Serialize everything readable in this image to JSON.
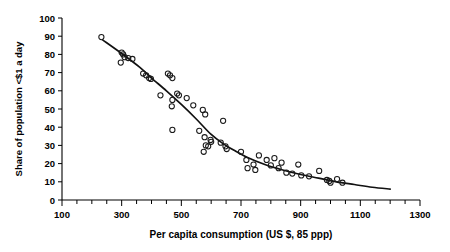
{
  "chart_data": {
    "type": "scatter",
    "title": "",
    "xlabel": "Per capita consumption (US $, 85 ppp)",
    "ylabel": "Share of population <$1 a day",
    "xlim": [
      100,
      1300
    ],
    "ylim": [
      0,
      100
    ],
    "x_ticks_major": [
      100,
      300,
      500,
      700,
      900,
      1100,
      1300
    ],
    "x_tick_labels": [
      "100",
      "300",
      "500",
      "700",
      "900",
      "1100",
      "1300"
    ],
    "x_minor_step": 50,
    "y_ticks": [
      0,
      10,
      20,
      30,
      40,
      50,
      60,
      70,
      80,
      90,
      100
    ],
    "y_tick_labels": [
      "0",
      "10",
      "20",
      "30",
      "40",
      "50",
      "60",
      "70",
      "80",
      "90",
      "100"
    ],
    "grid": false,
    "legend": null,
    "marker": "open-circle",
    "points": [
      {
        "x": 232,
        "y": 89.5
      },
      {
        "x": 300,
        "y": 81.0
      },
      {
        "x": 305,
        "y": 80.0
      },
      {
        "x": 310,
        "y": 78.5
      },
      {
        "x": 322,
        "y": 78.0
      },
      {
        "x": 336,
        "y": 77.5
      },
      {
        "x": 297,
        "y": 75.5
      },
      {
        "x": 372,
        "y": 69.5
      },
      {
        "x": 382,
        "y": 68.5
      },
      {
        "x": 392,
        "y": 67.0
      },
      {
        "x": 398,
        "y": 66.5
      },
      {
        "x": 455,
        "y": 69.5
      },
      {
        "x": 462,
        "y": 68.5
      },
      {
        "x": 470,
        "y": 67.0
      },
      {
        "x": 430,
        "y": 57.5
      },
      {
        "x": 486,
        "y": 58.5
      },
      {
        "x": 492,
        "y": 57.5
      },
      {
        "x": 470,
        "y": 55.0
      },
      {
        "x": 468,
        "y": 51.5
      },
      {
        "x": 518,
        "y": 56.0
      },
      {
        "x": 540,
        "y": 52.0
      },
      {
        "x": 572,
        "y": 49.5
      },
      {
        "x": 580,
        "y": 47.0
      },
      {
        "x": 640,
        "y": 43.5
      },
      {
        "x": 470,
        "y": 38.5
      },
      {
        "x": 560,
        "y": 38.0
      },
      {
        "x": 578,
        "y": 34.5
      },
      {
        "x": 598,
        "y": 33.0
      },
      {
        "x": 600,
        "y": 32.0
      },
      {
        "x": 582,
        "y": 30.0
      },
      {
        "x": 590,
        "y": 29.5
      },
      {
        "x": 575,
        "y": 26.5
      },
      {
        "x": 632,
        "y": 31.5
      },
      {
        "x": 648,
        "y": 29.5
      },
      {
        "x": 652,
        "y": 28.0
      },
      {
        "x": 700,
        "y": 26.5
      },
      {
        "x": 718,
        "y": 22.0
      },
      {
        "x": 742,
        "y": 19.5
      },
      {
        "x": 722,
        "y": 17.5
      },
      {
        "x": 748,
        "y": 16.5
      },
      {
        "x": 760,
        "y": 24.5
      },
      {
        "x": 786,
        "y": 22.0
      },
      {
        "x": 800,
        "y": 19.0
      },
      {
        "x": 812,
        "y": 23.0
      },
      {
        "x": 826,
        "y": 17.5
      },
      {
        "x": 836,
        "y": 20.5
      },
      {
        "x": 852,
        "y": 15.0
      },
      {
        "x": 872,
        "y": 14.5
      },
      {
        "x": 892,
        "y": 19.5
      },
      {
        "x": 902,
        "y": 13.5
      },
      {
        "x": 928,
        "y": 13.0
      },
      {
        "x": 962,
        "y": 16.0
      },
      {
        "x": 988,
        "y": 11.0
      },
      {
        "x": 996,
        "y": 10.5
      },
      {
        "x": 1000,
        "y": 9.5
      },
      {
        "x": 1022,
        "y": 11.5
      },
      {
        "x": 1040,
        "y": 9.5
      }
    ],
    "fit_curve": {
      "description": "fitted declining trend line",
      "points": [
        {
          "x": 236,
          "y": 88.0
        },
        {
          "x": 300,
          "y": 80.5
        },
        {
          "x": 360,
          "y": 73.0
        },
        {
          "x": 400,
          "y": 67.0
        },
        {
          "x": 450,
          "y": 60.0
        },
        {
          "x": 500,
          "y": 52.5
        },
        {
          "x": 550,
          "y": 44.5
        },
        {
          "x": 600,
          "y": 36.0
        },
        {
          "x": 640,
          "y": 31.0
        },
        {
          "x": 680,
          "y": 27.0
        },
        {
          "x": 720,
          "y": 23.5
        },
        {
          "x": 780,
          "y": 19.5
        },
        {
          "x": 840,
          "y": 16.5
        },
        {
          "x": 900,
          "y": 14.0
        },
        {
          "x": 960,
          "y": 12.0
        },
        {
          "x": 1020,
          "y": 10.0
        },
        {
          "x": 1080,
          "y": 8.5
        },
        {
          "x": 1140,
          "y": 7.0
        },
        {
          "x": 1200,
          "y": 6.0
        }
      ]
    }
  }
}
